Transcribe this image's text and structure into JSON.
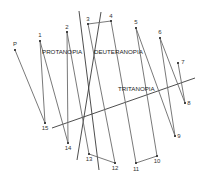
{
  "diagram": {
    "type": "color-arrangement-test-plot",
    "colors": {
      "line": "#6a6a6a",
      "axis": "#3a3a3a",
      "text": "#333333",
      "background": "#ffffff"
    },
    "axes": [
      {
        "label": "PROTANOPIA",
        "x1": 79,
        "y1": 11,
        "x2": 99,
        "y2": 170,
        "label_x": 42,
        "label_y": 54
      },
      {
        "label": "DEUTERANOPIA",
        "x1": 101,
        "y1": 12,
        "x2": 77,
        "y2": 160,
        "label_x": 94,
        "label_y": 54
      },
      {
        "label": "TRITANOPIA",
        "x1": 52,
        "y1": 128,
        "x2": 195,
        "y2": 78,
        "label_x": 118,
        "label_y": 91
      }
    ],
    "points": [
      {
        "id": "P",
        "label": "P",
        "x": 15,
        "y": 50,
        "lx": 15,
        "ly": 46
      },
      {
        "id": "1",
        "label": "1",
        "x": 40,
        "y": 41,
        "lx": 40,
        "ly": 37
      },
      {
        "id": "2",
        "label": "2",
        "x": 67,
        "y": 32,
        "lx": 67,
        "ly": 29
      },
      {
        "id": "3",
        "label": "3",
        "x": 88,
        "y": 24,
        "lx": 88,
        "ly": 21
      },
      {
        "id": "4",
        "label": "4",
        "x": 111,
        "y": 21,
        "lx": 111,
        "ly": 18
      },
      {
        "id": "5",
        "label": "5",
        "x": 136,
        "y": 28,
        "lx": 136,
        "ly": 24
      },
      {
        "id": "6",
        "label": "6",
        "x": 160,
        "y": 38,
        "lx": 160,
        "ly": 34
      },
      {
        "id": "7",
        "label": "7",
        "x": 178,
        "y": 63,
        "lx": 183,
        "ly": 64
      },
      {
        "id": "8",
        "label": "8",
        "x": 185,
        "y": 103,
        "lx": 189,
        "ly": 105
      },
      {
        "id": "9",
        "label": "9",
        "x": 175,
        "y": 136,
        "lx": 179,
        "ly": 138
      },
      {
        "id": "10",
        "label": "10",
        "x": 157,
        "y": 156,
        "lx": 157,
        "ly": 163
      },
      {
        "id": "11",
        "label": "11",
        "x": 136,
        "y": 163,
        "lx": 136,
        "ly": 171
      },
      {
        "id": "12",
        "label": "12",
        "x": 115,
        "y": 163,
        "lx": 115,
        "ly": 170
      },
      {
        "id": "13",
        "label": "13",
        "x": 89,
        "y": 154,
        "lx": 89,
        "ly": 161
      },
      {
        "id": "14",
        "label": "14",
        "x": 68,
        "y": 143,
        "lx": 68,
        "ly": 150
      },
      {
        "id": "15",
        "label": "15",
        "x": 45,
        "y": 123,
        "lx": 45,
        "ly": 130
      }
    ],
    "sequence": [
      "P",
      "15",
      "1",
      "14",
      "2",
      "13",
      "12",
      "3",
      "4",
      "11",
      "10",
      "5",
      "9",
      "6",
      "8",
      "7"
    ]
  }
}
